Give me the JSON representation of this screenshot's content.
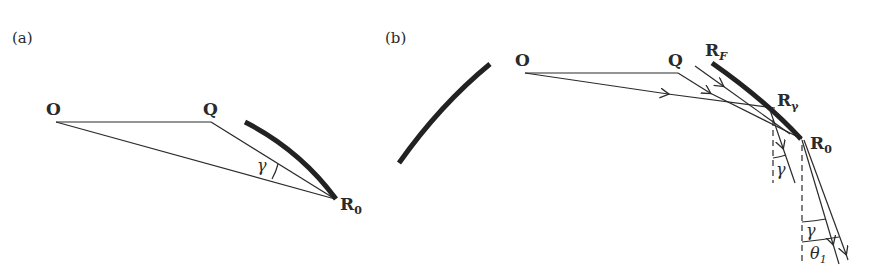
{
  "figure": {
    "panel_a": {
      "label": "(a)",
      "points": {
        "O": "O",
        "Q": "Q",
        "R0": "R",
        "R0_sub": "0"
      },
      "angle_label": "γ"
    },
    "panel_b": {
      "label": "(b)",
      "points": {
        "O": "O",
        "Q": "Q",
        "RF": "R",
        "RF_sub": "F",
        "Rg": "R",
        "Rg_sub": "γ",
        "R0": "R",
        "R0_sub": "0"
      },
      "angle_labels": {
        "gamma_1": "γ",
        "gamma_2": "γ",
        "theta": "θ",
        "theta_sub": "1"
      }
    }
  }
}
